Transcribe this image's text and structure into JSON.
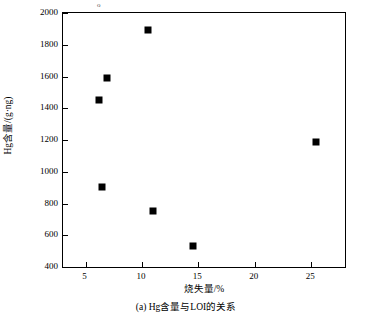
{
  "figure": {
    "caption": "(a) Hg含量与LOI的关系",
    "corner_mark": "o"
  },
  "chart_data": {
    "type": "scatter",
    "title": "",
    "subtitle": "",
    "xlabel": "烧失量/%",
    "ylabel": "Hg含量/(g·ng)",
    "xlim": [
      3.0,
      28.0
    ],
    "ylim": [
      400,
      2000
    ],
    "xticks": [
      5,
      10,
      15,
      20,
      25
    ],
    "yticks": [
      400,
      600,
      800,
      1000,
      1200,
      1400,
      1600,
      1800,
      2000
    ],
    "grid": false,
    "legend": null,
    "marker": "filled-square",
    "marker_color": "#000000",
    "series": [
      {
        "name": "Hg含量与LOI",
        "points": [
          {
            "x": 6.2,
            "y": 1450
          },
          {
            "x": 6.5,
            "y": 905
          },
          {
            "x": 6.9,
            "y": 1590
          },
          {
            "x": 10.5,
            "y": 1895
          },
          {
            "x": 11.0,
            "y": 750
          },
          {
            "x": 14.5,
            "y": 535
          },
          {
            "x": 25.4,
            "y": 1185
          }
        ]
      }
    ]
  }
}
